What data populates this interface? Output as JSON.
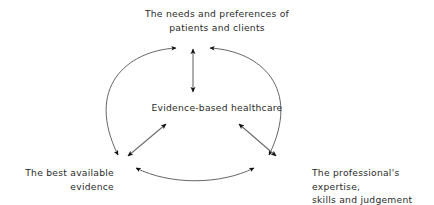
{
  "diagram": {
    "type": "cycle-diagram",
    "background_color": "#ffffff",
    "stroke_color": "#1a1a1a",
    "text_color": "#2b2b2b",
    "center": {
      "id": "evidence-based-healthcare",
      "label": "Evidence-based healthcare"
    },
    "nodes": [
      {
        "id": "needs-and-preferences",
        "position": "top",
        "label": "The needs and preferences of\npatients and clients"
      },
      {
        "id": "best-available-evidence",
        "position": "bottom-left",
        "label": "The best available\nevidence"
      },
      {
        "id": "professional-expertise",
        "position": "bottom-right",
        "label": "The professional's expertise,\nskills and judgement"
      }
    ],
    "connectors": [
      {
        "id": "center-to-top",
        "shape": "straight",
        "arrow": "double",
        "from": "evidence-based-healthcare",
        "to": "needs-and-preferences"
      },
      {
        "id": "center-to-bottom-left",
        "shape": "straight",
        "arrow": "double",
        "from": "evidence-based-healthcare",
        "to": "best-available-evidence"
      },
      {
        "id": "center-to-bottom-right",
        "shape": "straight",
        "arrow": "double",
        "from": "evidence-based-healthcare",
        "to": "professional-expertise"
      },
      {
        "id": "arc-top-to-bottom-left",
        "shape": "curved",
        "arrow": "double",
        "from": "needs-and-preferences",
        "to": "best-available-evidence"
      },
      {
        "id": "arc-top-to-bottom-right",
        "shape": "curved",
        "arrow": "double",
        "from": "needs-and-preferences",
        "to": "professional-expertise"
      },
      {
        "id": "arc-bottom-left-to-bottom-right",
        "shape": "curved",
        "arrow": "double",
        "from": "best-available-evidence",
        "to": "professional-expertise"
      }
    ]
  }
}
